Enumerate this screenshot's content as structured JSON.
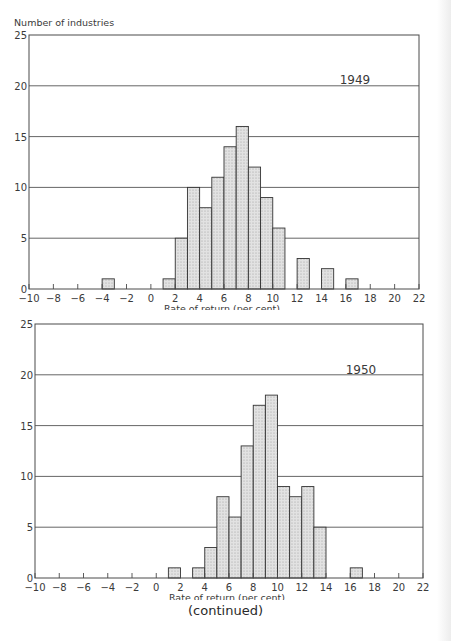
{
  "chart_data": [
    {
      "type": "bar",
      "title": "1949",
      "xlabel": "Rate of return (per cent)",
      "ylabel": "Number of industries",
      "xlim": [
        -10,
        22
      ],
      "ylim": [
        0,
        25
      ],
      "grid": "horizontal at 5,10,15,20",
      "x_ticks": [
        "-10",
        "-8",
        "-6",
        "-4",
        "-2",
        "0",
        "2",
        "4",
        "6",
        "8",
        "10",
        "12",
        "14",
        "16",
        "18",
        "20",
        "22"
      ],
      "y_ticks": [
        "0",
        "5",
        "10",
        "15",
        "20",
        "25"
      ],
      "bins": [
        {
          "from": -4,
          "to": -3,
          "count": 1
        },
        {
          "from": 1,
          "to": 2,
          "count": 1
        },
        {
          "from": 2,
          "to": 3,
          "count": 5
        },
        {
          "from": 3,
          "to": 4,
          "count": 10
        },
        {
          "from": 4,
          "to": 5,
          "count": 8
        },
        {
          "from": 5,
          "to": 6,
          "count": 11
        },
        {
          "from": 6,
          "to": 7,
          "count": 14
        },
        {
          "from": 7,
          "to": 8,
          "count": 16
        },
        {
          "from": 8,
          "to": 9,
          "count": 12
        },
        {
          "from": 9,
          "to": 10,
          "count": 9
        },
        {
          "from": 10,
          "to": 11,
          "count": 6
        },
        {
          "from": 12,
          "to": 13,
          "count": 3
        },
        {
          "from": 14,
          "to": 15,
          "count": 2
        },
        {
          "from": 16,
          "to": 17,
          "count": 1
        }
      ]
    },
    {
      "type": "bar",
      "title": "1950",
      "xlabel": "Rate of return (per cent)",
      "ylabel": "",
      "xlim": [
        -10,
        22
      ],
      "ylim": [
        0,
        25
      ],
      "grid": "horizontal at 5,10,15,20",
      "x_ticks": [
        "-10",
        "-8",
        "-6",
        "-4",
        "-2",
        "0",
        "2",
        "4",
        "6",
        "8",
        "10",
        "12",
        "14",
        "16",
        "18",
        "20",
        "22"
      ],
      "y_ticks": [
        "0",
        "5",
        "10",
        "15",
        "20",
        "25"
      ],
      "bins": [
        {
          "from": 1,
          "to": 2,
          "count": 1
        },
        {
          "from": 3,
          "to": 4,
          "count": 1
        },
        {
          "from": 4,
          "to": 5,
          "count": 3
        },
        {
          "from": 5,
          "to": 6,
          "count": 8
        },
        {
          "from": 6,
          "to": 7,
          "count": 6
        },
        {
          "from": 7,
          "to": 8,
          "count": 13
        },
        {
          "from": 8,
          "to": 9,
          "count": 17
        },
        {
          "from": 9,
          "to": 10,
          "count": 18
        },
        {
          "from": 10,
          "to": 11,
          "count": 9
        },
        {
          "from": 11,
          "to": 12,
          "count": 8
        },
        {
          "from": 12,
          "to": 13,
          "count": 9
        },
        {
          "from": 13,
          "to": 14,
          "count": 5
        },
        {
          "from": 16,
          "to": 17,
          "count": 1
        }
      ]
    }
  ],
  "charts": [
    {
      "year_label": "1949",
      "y_axis_title": "Number of industries",
      "x_axis_title": "Rate of return (per cent)"
    },
    {
      "year_label": "1950",
      "y_axis_title": "",
      "x_axis_title": "Rate of return (per cent)"
    }
  ],
  "footer": {
    "text": "(continued)"
  },
  "colors": {
    "frame": "#4a4a4a",
    "grid": "#555555",
    "bar_fill": "#e2e2e2",
    "bar_stroke": "#333333",
    "text": "#3a3a3a"
  }
}
